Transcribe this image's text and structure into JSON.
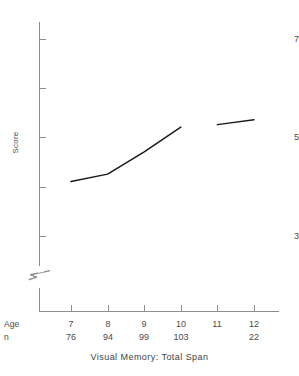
{
  "chart_data": {
    "type": "line",
    "title": "Visual Memory: Total Span",
    "xlabel": "Age",
    "ylabel": "Score",
    "categories": [
      "7",
      "8",
      "9",
      "10",
      "11",
      "12"
    ],
    "x": [
      7,
      8,
      9,
      10,
      11,
      12
    ],
    "values": [
      4.1,
      4.25,
      4.7,
      5.2,
      5.25,
      5.35
    ],
    "series": [
      {
        "name": "Visual Memory: Total Span",
        "values": [
          4.1,
          4.25,
          4.7,
          5.2,
          5.25,
          5.35
        ]
      }
    ],
    "ylim": [
      3,
      7
    ],
    "y_ticks_major": [
      "7",
      "5",
      "3"
    ],
    "y_ticks_major_values": [
      7,
      5,
      3
    ],
    "y_ticks_minor_values": [
      6,
      4
    ],
    "xlim": [
      7,
      12
    ],
    "grid": "off",
    "legend": "none",
    "y_axis_break": true,
    "line_gap_between": [
      "10",
      "11"
    ],
    "line_color": "#1a1a1a",
    "axis_color": "#8e8e8e"
  },
  "axes": {
    "y_title": "Score",
    "y_labels": [
      {
        "text": "7",
        "value": 7
      },
      {
        "text": "5",
        "value": 5
      },
      {
        "text": "3",
        "value": 3
      }
    ]
  },
  "bottom_table": {
    "row_labels": {
      "age": "Age",
      "n": "n"
    },
    "age": [
      "7",
      "8",
      "9",
      "10",
      "11",
      "12"
    ],
    "n": [
      "76",
      "94",
      "99",
      "103",
      "",
      "22"
    ]
  },
  "title": {
    "text": "Visual Memory: Total Span"
  }
}
